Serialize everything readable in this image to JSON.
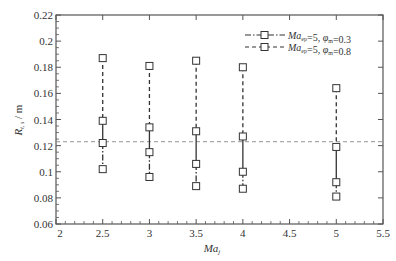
{
  "chart_data": {
    "type": "scatter",
    "title": "",
    "xlabel": "Ma_j",
    "ylabel": "R_t,s / m",
    "xlim": [
      2,
      5.5
    ],
    "ylim": [
      0.06,
      0.22
    ],
    "x_ticks": [
      "2",
      "2.5",
      "3",
      "3.5",
      "4",
      "4.5",
      "5",
      "5.5"
    ],
    "y_ticks": [
      "0.06",
      "0.08",
      "0.1",
      "0.12",
      "0.14",
      "0.16",
      "0.18",
      "0.2",
      "0.22"
    ],
    "grid": false,
    "legend_position": "top-right",
    "reference_line": {
      "y": 0.123,
      "style": "dashed",
      "color": "#888888"
    },
    "x": [
      2.5,
      3,
      3.5,
      4,
      5
    ],
    "series": [
      {
        "name": "Ma_ep=5, φ_m=0.3",
        "line_style": "dash-dot",
        "marker": "square",
        "upper": [
          0.122,
          0.115,
          0.106,
          0.1,
          0.092
        ],
        "lower": [
          0.102,
          0.096,
          0.089,
          0.087,
          0.081
        ]
      },
      {
        "name": "Ma_ep=5, φ_m=0.8",
        "line_style": "dashed",
        "marker": "square",
        "upper": [
          0.187,
          0.181,
          0.185,
          0.18,
          0.164
        ],
        "lower": [
          0.139,
          0.134,
          0.131,
          0.127,
          0.119
        ]
      }
    ]
  },
  "axes": {
    "xlabel_main": "Ma",
    "xlabel_sub": "j",
    "ylabel_main": "R",
    "ylabel_sub": "t, s",
    "ylabel_unit": "/ m"
  },
  "legend": [
    {
      "main": "Ma",
      "sub": "ep",
      "rest": "=5, φ",
      "sub2": "m",
      "val": "=0.3"
    },
    {
      "main": "Ma",
      "sub": "ep",
      "rest": "=5, φ",
      "sub2": "m",
      "val": "=0.8"
    }
  ]
}
